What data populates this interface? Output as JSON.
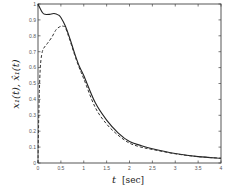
{
  "chart_data": {
    "type": "line",
    "title": "",
    "xlabel": "t [sec]",
    "ylabel": "x1(t), x̂1(t)",
    "xlim": [
      0,
      4
    ],
    "ylim": [
      0,
      1
    ],
    "grid": false,
    "legend": null,
    "x_ticks": [
      "0",
      "0.5",
      "1",
      "1.5",
      "2",
      "2.5",
      "3",
      "3.5",
      "4"
    ],
    "y_ticks": [
      "0",
      "0.1",
      "0.2",
      "0.3",
      "0.4",
      "0.5",
      "0.6",
      "0.7",
      "0.8",
      "0.9",
      "1"
    ],
    "series": [
      {
        "name": "x1(t)",
        "style": "solid",
        "color": "#222222",
        "x": [
          0,
          0.05,
          0.1,
          0.15,
          0.25,
          0.35,
          0.45,
          0.5,
          0.6,
          0.7,
          0.8,
          0.9,
          1.0,
          1.25,
          1.5,
          1.75,
          2.0,
          2.25,
          2.5,
          3.0,
          3.5,
          4.0
        ],
        "y": [
          1.0,
          0.97,
          0.945,
          0.935,
          0.935,
          0.94,
          0.93,
          0.915,
          0.86,
          0.78,
          0.69,
          0.61,
          0.55,
          0.38,
          0.27,
          0.19,
          0.135,
          0.11,
          0.09,
          0.06,
          0.04,
          0.03
        ]
      },
      {
        "name": "x̂1(t)",
        "style": "dashed",
        "color": "#333333",
        "x": [
          0,
          0.01,
          0.03,
          0.05,
          0.08,
          0.12,
          0.2,
          0.3,
          0.4,
          0.5,
          0.55,
          0.6,
          0.7,
          0.8,
          0.9,
          1.0,
          1.25,
          1.5,
          1.75,
          2.0,
          2.25,
          2.5,
          3.0,
          3.5,
          4.0
        ],
        "y": [
          0.0,
          0.2,
          0.45,
          0.6,
          0.68,
          0.72,
          0.75,
          0.79,
          0.84,
          0.86,
          0.86,
          0.85,
          0.77,
          0.68,
          0.6,
          0.53,
          0.35,
          0.245,
          0.175,
          0.125,
          0.1,
          0.085,
          0.058,
          0.04,
          0.03
        ]
      }
    ]
  },
  "axes": {
    "x_label_main": "t",
    "x_label_unit": "[sec]",
    "y_label": "x₁(t), x̂₁(t)"
  }
}
